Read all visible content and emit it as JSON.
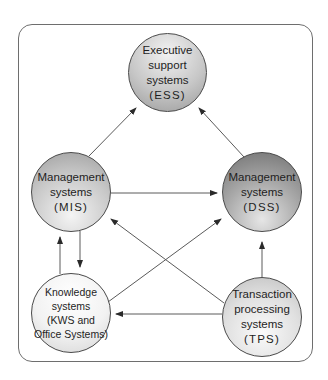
{
  "diagram": {
    "title": "",
    "nodes": [
      {
        "id": "ess",
        "lines": [
          "Executive",
          "support",
          "systems",
          "(ESS)"
        ]
      },
      {
        "id": "mis",
        "lines": [
          "Management",
          "systems",
          "(MIS)"
        ]
      },
      {
        "id": "dss",
        "lines": [
          "Management",
          "systems",
          "(DSS)"
        ]
      },
      {
        "id": "kws",
        "lines": [
          "Knowledge",
          "systems",
          "(KWS and",
          "Office Systems)"
        ]
      },
      {
        "id": "tps",
        "lines": [
          "Transaction",
          "processing",
          "systems",
          "(TPS)"
        ]
      }
    ],
    "edges": [
      {
        "from": "mis",
        "to": "ess"
      },
      {
        "from": "dss",
        "to": "ess"
      },
      {
        "from": "mis",
        "to": "dss"
      },
      {
        "from": "kws",
        "to": "mis"
      },
      {
        "from": "mis",
        "to": "kws"
      },
      {
        "from": "kws",
        "to": "dss"
      },
      {
        "from": "tps",
        "to": "mis"
      },
      {
        "from": "tps",
        "to": "dss"
      },
      {
        "from": "tps",
        "to": "kws"
      }
    ],
    "colors": {
      "line": "#5a5a5a",
      "border": "#6e6e6e",
      "text": "#1e1e1e"
    }
  }
}
